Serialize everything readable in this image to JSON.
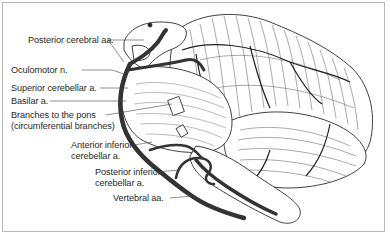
{
  "figure": {
    "colors": {
      "artery": "#3a3a3a",
      "outline": "#2b2b2b",
      "frame": "#b9b9b9",
      "text": "#2a2a2a"
    },
    "labels": [
      {
        "id": "posterior-cerebral",
        "lines": [
          "Posterior cerebral aa."
        ]
      },
      {
        "id": "oculomotor",
        "lines": [
          "Oculomotor n."
        ]
      },
      {
        "id": "superior-cerebellar",
        "lines": [
          "Superior cerebellar a."
        ]
      },
      {
        "id": "basilar",
        "lines": [
          "Basilar a."
        ]
      },
      {
        "id": "pontine-branches",
        "lines": [
          "Branches to the pons",
          "(circumferential branches)"
        ]
      },
      {
        "id": "aica",
        "lines": [
          "Anterior inferior",
          "cerebellar a."
        ]
      },
      {
        "id": "pica",
        "lines": [
          "Posterior inferior",
          "cerebellar a."
        ]
      },
      {
        "id": "vertebral",
        "lines": [
          "Vertebral aa."
        ]
      }
    ]
  }
}
